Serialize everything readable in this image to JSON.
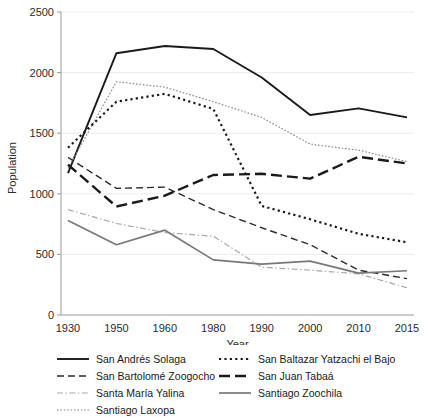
{
  "chart_data": {
    "type": "line",
    "title": "",
    "xlabel": "Year",
    "ylabel": "Population",
    "categories": [
      "1930",
      "1950",
      "1960",
      "1980",
      "1990",
      "2000",
      "2010",
      "2015"
    ],
    "ylim": [
      0,
      2500
    ],
    "yticks": [
      "0",
      "500",
      "1000",
      "1500",
      "2000",
      "2500"
    ],
    "grid": true,
    "legend_position": "bottom",
    "series": [
      {
        "name": "San Andrés Solaga",
        "style": "solid",
        "color": "#1a1a1a",
        "values": [
          1170,
          2160,
          2220,
          2195,
          1960,
          1650,
          1705,
          1630
        ]
      },
      {
        "name": "San Bartolomé Zoogocho",
        "style": "dashed",
        "color": "#2b2b2b",
        "values": [
          1300,
          1045,
          1055,
          870,
          720,
          580,
          370,
          300
        ]
      },
      {
        "name": "Santa María Yalina",
        "style": "dashdot",
        "color": "#a8a8a8",
        "values": [
          870,
          755,
          680,
          650,
          395,
          370,
          340,
          225
        ]
      },
      {
        "name": "Santiago Laxopa",
        "style": "dotted-fine",
        "color": "#8c8c8c",
        "values": [
          1210,
          1925,
          1880,
          1760,
          1630,
          1410,
          1360,
          1265
        ]
      },
      {
        "name": "San Baltazar Yatzachi el Bajo",
        "style": "dotted",
        "color": "#1a1a1a",
        "values": [
          1380,
          1760,
          1825,
          1700,
          900,
          790,
          670,
          600
        ]
      },
      {
        "name": "San Juan Tabaá",
        "style": "longdash",
        "color": "#1a1a1a",
        "values": [
          1240,
          895,
          985,
          1155,
          1165,
          1125,
          1305,
          1250
        ]
      },
      {
        "name": "Santiago Zoochila",
        "style": "solid-gray",
        "color": "#787878",
        "values": [
          780,
          580,
          700,
          455,
          420,
          445,
          345,
          365
        ]
      }
    ]
  },
  "legend": {
    "left_column": [
      {
        "label": "San Andrés Solaga"
      },
      {
        "label": "San Bartolomé Zoogocho"
      },
      {
        "label": "Santa María Yalina"
      },
      {
        "label": "Santiago Laxopa"
      }
    ],
    "right_column": [
      {
        "label": "San Baltazar Yatzachi el Bajo"
      },
      {
        "label": "San Juan Tabaá"
      },
      {
        "label": "Santiago Zoochila"
      }
    ]
  }
}
